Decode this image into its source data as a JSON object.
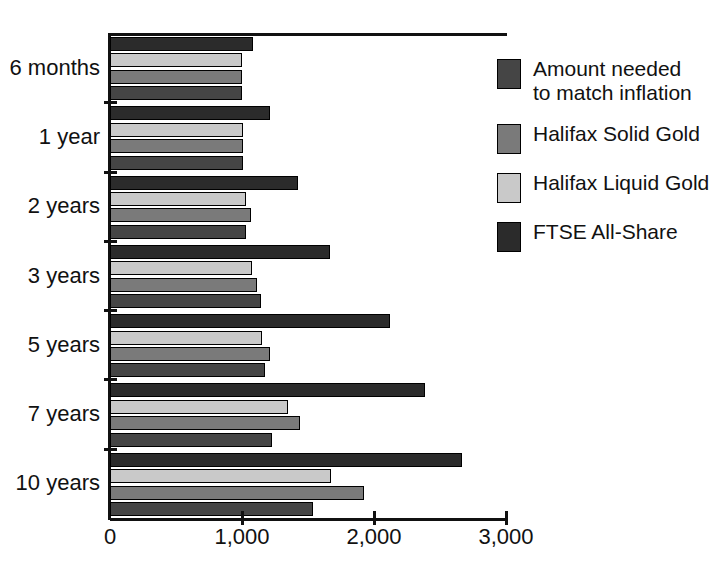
{
  "chart_data": {
    "type": "bar",
    "orientation": "horizontal",
    "title": "",
    "xlabel": "",
    "ylabel": "",
    "xlim": [
      0,
      3000
    ],
    "xticks": [
      0,
      1000,
      2000,
      3000
    ],
    "xtick_labels": [
      "0",
      "1,000",
      "2,000",
      "3,000"
    ],
    "grid": false,
    "legend_position": "right",
    "categories": [
      "6 months",
      "1 year",
      "2 years",
      "3 years",
      "5 years",
      "7 years",
      "10 years"
    ],
    "series": [
      {
        "name": "FTSE All-Share",
        "color": "#2b2b2b",
        "values": [
          1085,
          1210,
          1425,
          1665,
          2120,
          2385,
          2665
        ]
      },
      {
        "name": "Halifax Liquid Gold",
        "color": "#c9c9c9",
        "values": [
          1000,
          1010,
          1030,
          1075,
          1150,
          1350,
          1675
        ]
      },
      {
        "name": "Halifax Solid Gold",
        "color": "#7a7a7a",
        "values": [
          1000,
          1010,
          1070,
          1115,
          1210,
          1440,
          1925
        ]
      },
      {
        "name": "Amount needed to match inflation",
        "color": "#454545",
        "values": [
          1000,
          1010,
          1030,
          1145,
          1175,
          1225,
          1540
        ]
      }
    ],
    "bar_order_top_to_bottom": [
      "FTSE All-Share",
      "Halifax Liquid Gold",
      "Halifax Solid Gold",
      "Amount needed to match inflation"
    ]
  },
  "legend": {
    "items": [
      {
        "label": "Amount needed\nto match inflation",
        "swatch": "sw-inflation"
      },
      {
        "label": "Halifax Solid Gold",
        "swatch": "sw-solid"
      },
      {
        "label": "Halifax Liquid Gold",
        "swatch": "sw-liquid"
      },
      {
        "label": "FTSE All-Share",
        "swatch": "sw-ftse"
      }
    ]
  }
}
